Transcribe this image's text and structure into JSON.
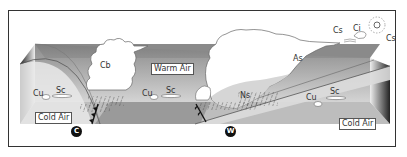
{
  "diagram": {
    "air_masses": {
      "warm": "Warm Air",
      "cold_left": "Cold Air",
      "cold_right": "Cold Air"
    },
    "clouds": {
      "cb": "Cb",
      "as": "As",
      "ns": "Ns",
      "cs_top": "Cs",
      "ci": "Ci",
      "cs_sun": "Cs",
      "cu_left": "Cu",
      "sc_left": "Sc",
      "cu_mid": "Cu",
      "sc_mid": "Sc",
      "cu_right": "Cu",
      "sc_right": "Sc"
    },
    "fronts": {
      "cold_marker": "C",
      "warm_marker": "W"
    },
    "colors": {
      "frame": "#333333",
      "ground": "#a9a9a9",
      "box_dark": "#7a7a7a",
      "cloud": "#ffffff",
      "ns_shade": "#d9d9d9",
      "marker": "#111111"
    }
  }
}
